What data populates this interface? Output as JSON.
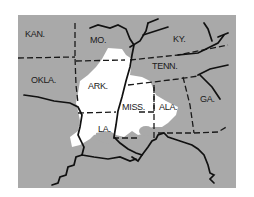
{
  "map": {
    "background_color": "#a9a9a9",
    "highlight_color": "#ffffff",
    "line_color": "#111111",
    "states": [
      {
        "id": "kan",
        "label": "KAN."
      },
      {
        "id": "mo",
        "label": "MO."
      },
      {
        "id": "ky",
        "label": "KY."
      },
      {
        "id": "okla",
        "label": "OKLA."
      },
      {
        "id": "tenn",
        "label": "TENN."
      },
      {
        "id": "ark",
        "label": "ARK."
      },
      {
        "id": "miss",
        "label": "MISS."
      },
      {
        "id": "ala",
        "label": "ALA."
      },
      {
        "id": "ga",
        "label": "GA."
      },
      {
        "id": "la",
        "label": "LA."
      }
    ]
  }
}
